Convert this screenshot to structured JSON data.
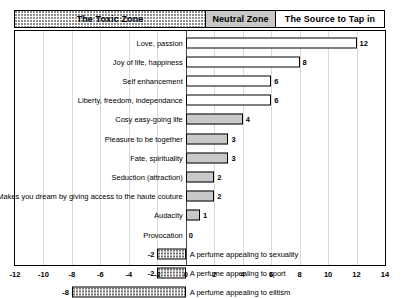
{
  "zones": [
    {
      "name": "zone-toxic",
      "label": "The Toxic Zone",
      "fill": "dotted",
      "from": -12,
      "to": 0
    },
    {
      "name": "zone-neutral",
      "label": "Neutral Zone",
      "fill": "gray",
      "from": 0,
      "to": 4
    },
    {
      "name": "zone-source",
      "label": "The Source to Tap in",
      "fill": "white",
      "from": 4,
      "to": 14
    }
  ],
  "colors": {
    "neutral_zone_fill": "#c8c8c8",
    "positive_bar_fill": "#ffffff",
    "gray_bar_fill": "#c8c8c8",
    "negative_bar_fill": "#ffffff",
    "frame": "#000000",
    "gridline": "#d9d9d9"
  },
  "chart_data": {
    "type": "bar",
    "orientation": "horizontal",
    "title": "",
    "xlabel": "",
    "ylabel": "",
    "xlim": [
      -12,
      14
    ],
    "xticks": [
      -12,
      -10,
      -8,
      -6,
      -4,
      -2,
      0,
      2,
      4,
      6,
      8,
      10,
      12,
      14
    ],
    "grid": true,
    "legend": false,
    "categories": [
      "Love, passion",
      "Joy of life, happiness",
      "Self enhancement",
      "Liberty, freedom, independance",
      "Cosy easy-going life",
      "Pleasure to be together",
      "Fate, spirituality",
      "Seduction (attraction)",
      "Makes you dream by giving access to the haute couture",
      "Audacity",
      "Provocation",
      "A perfume appealing to sexuality",
      "A perfume appealing to sport",
      "A perfume appealing to elitism"
    ],
    "values": [
      12,
      8,
      6,
      6,
      4,
      3,
      3,
      2,
      2,
      1,
      0,
      -2,
      -2,
      -8
    ],
    "bar_styles": [
      "white",
      "white",
      "white",
      "white",
      "gray",
      "gray",
      "gray",
      "gray",
      "gray",
      "gray",
      "none",
      "dotted",
      "dotted",
      "dotted"
    ],
    "label_side": [
      "left",
      "left",
      "left",
      "left",
      "left",
      "left",
      "left",
      "left",
      "left",
      "left",
      "left",
      "right",
      "right",
      "right"
    ]
  }
}
